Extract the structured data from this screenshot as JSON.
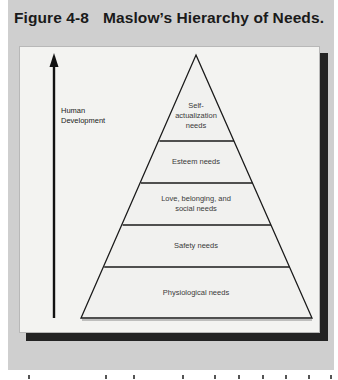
{
  "figure": {
    "number": "Figure 4-8",
    "title": "Maslow’s Hierarchy of Needs."
  },
  "axis": {
    "label_line1": "Human",
    "label_line2": "Development",
    "direction": "up-arrow-icon"
  },
  "pyramid": {
    "levels": [
      {
        "line1": "Self-",
        "line2": "actualization",
        "line3": "needs"
      },
      {
        "line1": "Esteem needs"
      },
      {
        "line1": "Love, belonging, and",
        "line2": "social needs"
      },
      {
        "line1": "Safety needs"
      },
      {
        "line1": "Physiological needs"
      }
    ]
  },
  "colors": {
    "panel": "#cfcfcf",
    "figure_bg": "#f3f3f1",
    "shadow": "#232323",
    "lines": "#1a1a1a"
  }
}
